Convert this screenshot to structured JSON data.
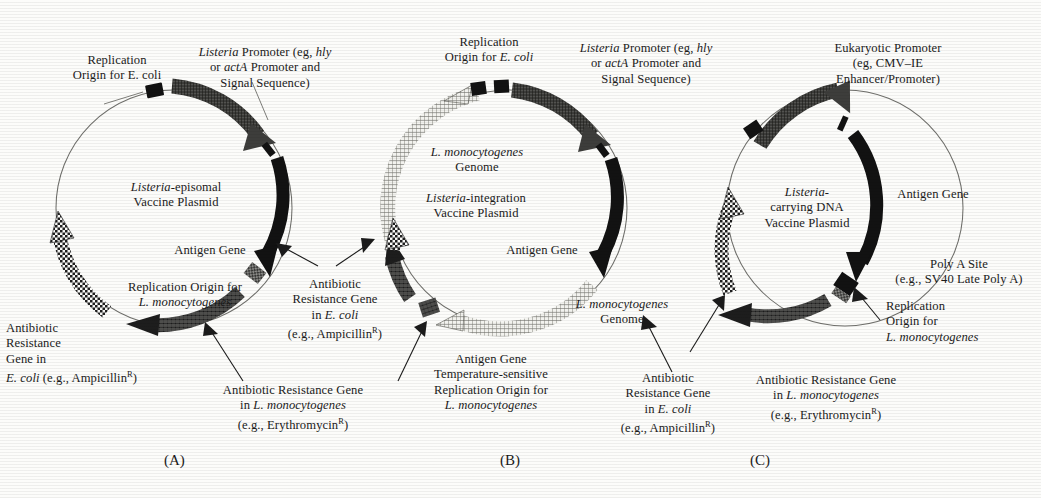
{
  "figure": {
    "caption_ids": [
      "(A)",
      "(B)",
      "(C)"
    ],
    "panels": [
      {
        "id": "(A)",
        "center_title_line1": "Listeria-episomal",
        "center_title_line2": "Vaccine Plasmid",
        "labels": {
          "replication_origin_ecoli": "Replication\nOrigin for E. coli",
          "listeria_promoter": "Listeria Promoter (eg, hly\nor actA Promoter and\nSignal Sequence)",
          "antigen_gene": "Antigen Gene",
          "replication_origin_lmono": "Replication Origin for\nL. monocytogenes",
          "antibiotic_ecoli": "Antibiotic\nResistance\nGene in\nE. coli (e.g., AmpicillinR)",
          "antibiotic_lmono": "Antibiotic Resistance Gene\nin L. monocytogenes\n(e.g., ErythromycinR)"
        }
      },
      {
        "id": "(B)",
        "center_title_line1": "L. monocytogenes",
        "center_title_line2": "Genome",
        "center_title_line3": "Listeria-integration",
        "center_title_line4": "Vaccine Plasmid",
        "labels": {
          "replication_origin_ecoli": "Replication\nOrigin for E. coli",
          "listeria_promoter": "Listeria Promoter (eg, hly\nor actA Promoter and\nSignal Sequence)",
          "antigen_gene": "Antigen Gene",
          "genome_right": "L. monocytogenes\nGenome",
          "antibiotic_ecoli": "Antibiotic\nResistance Gene\nin E. coli\n(e.g., AmpicillinR)",
          "ts_origin": "Antigen Gene\nTemperature-sensitive\nReplication Origin for\nL. monocytogenes"
        }
      },
      {
        "id": "(C)",
        "center_title_line1": "Listeria-",
        "center_title_line2": "carrying DNA",
        "center_title_line3": "Vaccine Plasmid",
        "labels": {
          "eukaryotic_promoter": "Eukaryotic Promoter\n(eg, CMV–IE\nEnhancer/Promoter)",
          "antigen_gene": "Antigen Gene",
          "poly_a": "Poly A Site\n(e.g., SV40 Late Poly A)",
          "replication_origin_lmono": "Replication\nOrigin for\nL. monocytogenes",
          "antibiotic_ecoli": "Antibiotic\nResistance Gene\nin E. coli\n(e.g., AmpicillinR)",
          "antibiotic_lmono": "Antibiotic Resistance Gene\nin L. monocytogenes\n(e.g., ErythromycinR)"
        }
      }
    ]
  },
  "colors": {
    "ink": "#1b1b1b",
    "circle_line": "#6a6a66",
    "solid_black": "#121212",
    "dark_hatch": "#2a2a2a",
    "light_hatch": "#a8a8a4",
    "paper": "#fcfcfa"
  }
}
